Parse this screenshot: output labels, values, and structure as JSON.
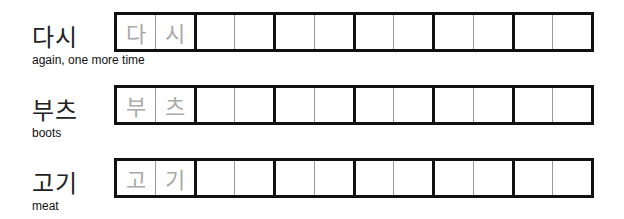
{
  "rows": [
    {
      "word": "다시",
      "gloss": "again, one more time",
      "trace": [
        "다",
        "시"
      ]
    },
    {
      "word": "부츠",
      "gloss": "boots",
      "trace": [
        "부",
        "츠"
      ]
    },
    {
      "word": "고기",
      "gloss": "meat",
      "trace": [
        "고",
        "기"
      ]
    }
  ],
  "grid": {
    "pairs_per_row": 6,
    "cells_per_pair": 2
  }
}
